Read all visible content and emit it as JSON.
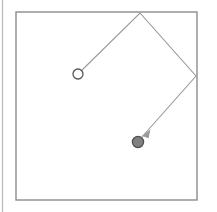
{
  "canvas": {
    "width": 217,
    "height": 212,
    "background_color": "#ffffff"
  },
  "colors": {
    "frame_stroke": "#8c8c8c",
    "edge_rule_stroke": "#b8b8b8",
    "path_stroke": "#9a9a9a",
    "start_marker_stroke": "#555555",
    "start_marker_fill": "#ffffff",
    "end_marker_fill": "#808080",
    "end_marker_stroke": "#4d4d4d",
    "arrowhead_fill": "#9a9a9a"
  },
  "frame": {
    "label": "enclosure-boundary",
    "x": 16,
    "y": 12,
    "width": 181,
    "height": 188,
    "stroke_width": 1.4
  },
  "edge_rule": {
    "label": "left-edge-rule",
    "x": 2.5,
    "y1": 0,
    "y2": 212,
    "stroke_width": 1.2
  },
  "trajectory": {
    "label": "bouncing-path",
    "stroke_width": 1.1,
    "points": [
      {
        "name": "start-open-circle",
        "x": 78,
        "y": 74
      },
      {
        "name": "top-bounce-vertex",
        "x": 140,
        "y": 13
      },
      {
        "name": "right-bounce-vertex",
        "x": 196,
        "y": 76
      },
      {
        "name": "end-filled-circle",
        "x": 141,
        "y": 138
      }
    ],
    "polyline": "78,74 140,13 196,76 141,138"
  },
  "start_marker": {
    "label": "start-point",
    "cx": 78,
    "cy": 74,
    "r": 5,
    "stroke_width": 1.3,
    "style": "open"
  },
  "end_marker": {
    "label": "end-point",
    "cx": 138,
    "cy": 142,
    "r": 5.6,
    "stroke_width": 1.2,
    "style": "filled"
  },
  "arrowhead": {
    "label": "direction-arrowhead",
    "tip_x": 142,
    "tip_y": 136,
    "points": "142,136 150.4,129.6 148.6,138.2",
    "angle_deg": 225
  }
}
